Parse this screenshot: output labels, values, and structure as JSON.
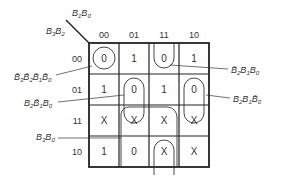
{
  "kmap": {
    "col_var_label": "B1B0",
    "row_var_label": "B3B2",
    "columns": [
      "00",
      "01",
      "11",
      "10"
    ],
    "rows": [
      "00",
      "01",
      "11",
      "10"
    ],
    "cells": [
      [
        "0",
        "1",
        "0",
        "1"
      ],
      [
        "1",
        "0",
        "1",
        "0"
      ],
      [
        "X",
        "X",
        "X",
        "X"
      ],
      [
        "1",
        "0",
        "X",
        "X"
      ]
    ]
  },
  "groupings": [
    {
      "term": "B̄3B̄2B̄1B̄0",
      "cells": "row00,col00"
    },
    {
      "term": "B̄2B1B0",
      "cells": "col11 rows 00"
    },
    {
      "term": "B̄2B̄1B0",
      "cells": "col01 rows 01-11"
    },
    {
      "term": "B2B1B̄0",
      "cells": "col10 rows 01-11"
    },
    {
      "term": "B3B0",
      "cells": "cols 01-11 rows 11-10"
    }
  ]
}
